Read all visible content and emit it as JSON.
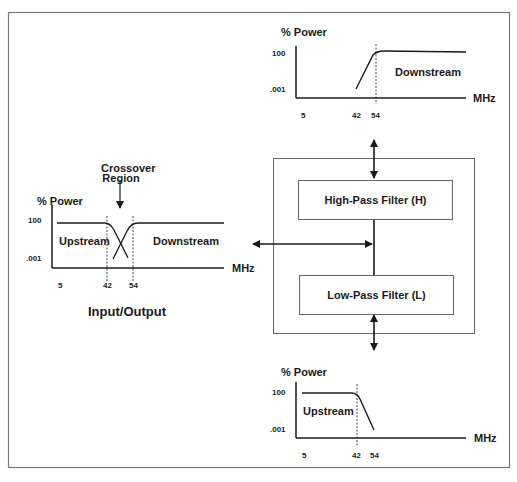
{
  "diagram": {
    "caption": "Input/Output",
    "crossover_label_line1": "Crossover",
    "crossover_label_line2": "Region",
    "high_pass_filter": "High-Pass Filter (H)",
    "low_pass_filter": "Low-Pass Filter (L)"
  },
  "charts": {
    "input_output": {
      "y_title": "% Power",
      "y_ticks": [
        "100",
        ".001"
      ],
      "x_ticks": [
        "5",
        "42",
        "54"
      ],
      "x_unit": "MHz",
      "regions": [
        "Upstream",
        "Downstream"
      ]
    },
    "high_pass": {
      "y_title": "% Power",
      "y_ticks": [
        "100",
        ".001"
      ],
      "x_ticks": [
        "5",
        "42",
        "54"
      ],
      "x_unit": "MHz",
      "region": "Downstream"
    },
    "low_pass": {
      "y_title": "% Power",
      "y_ticks": [
        "100",
        ".001"
      ],
      "x_ticks": [
        "5",
        "42",
        "54"
      ],
      "x_unit": "MHz",
      "region": "Upstream"
    }
  },
  "colors": {
    "line": "#1a1a1a",
    "frame": "#777777",
    "background": "#ffffff"
  }
}
